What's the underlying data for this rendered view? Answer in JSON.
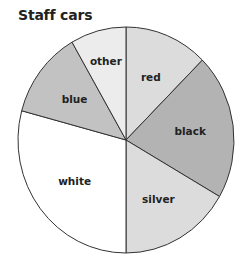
{
  "chart_data": {
    "type": "pie",
    "title": "Staff cars",
    "categories": [
      "red",
      "black",
      "silver",
      "white",
      "blue",
      "other"
    ],
    "values": [
      9,
      15,
      12,
      21,
      9,
      6
    ],
    "angles_deg": [
      45,
      75,
      60,
      105,
      45,
      30
    ],
    "start_angle": "12 o'clock, clockwise",
    "colors": [
      "#dcdcdc",
      "#b3b3b3",
      "#dcdcdc",
      "#ffffff",
      "#c2c2c2",
      "#ececec"
    ],
    "legend": "none (labels inside slices)",
    "xlabel": "",
    "ylabel": ""
  }
}
